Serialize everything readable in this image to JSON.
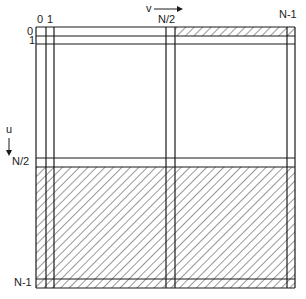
{
  "diagram": {
    "axis_v": {
      "label": "v",
      "direction": "right-arrow"
    },
    "axis_u": {
      "label": "u",
      "direction": "down-arrow"
    },
    "column_labels": [
      "0",
      "1",
      "N/2",
      "N-1"
    ],
    "row_labels": [
      "0",
      "1",
      "N/2",
      "N-1"
    ],
    "colors": {
      "line": "#1a1a1a",
      "hatch": "#333333",
      "background": "#ffffff"
    },
    "hatched_regions": [
      "row 0 from column N/2+1 through N-1",
      "rows N/2+1 through N-1 (entire lower half)"
    ]
  }
}
